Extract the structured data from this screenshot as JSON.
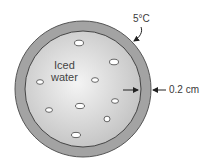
{
  "diagram": {
    "outer_label": "5°C",
    "thickness_label": "0.2 cm",
    "contents_label_line1": "Iced",
    "contents_label_line2": "water",
    "colors": {
      "shell": "#9a9a9a",
      "interior_light": "#f2f2f2",
      "interior_dark": "#c4c4c4",
      "outline": "#555555",
      "ice": "#ffffff"
    },
    "ice_cubes": [
      {
        "x": 79,
        "y": 43
      },
      {
        "x": 114,
        "y": 62
      },
      {
        "x": 40,
        "y": 82
      },
      {
        "x": 95,
        "y": 80
      },
      {
        "x": 80,
        "y": 106
      },
      {
        "x": 115,
        "y": 101
      },
      {
        "x": 49,
        "y": 110
      },
      {
        "x": 107,
        "y": 119
      },
      {
        "x": 76,
        "y": 135
      }
    ]
  }
}
